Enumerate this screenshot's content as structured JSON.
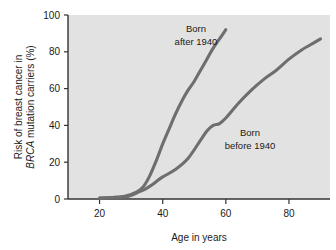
{
  "chart_data": {
    "type": "line",
    "title": "",
    "xlabel": "Age in years",
    "ylabel_line1": "Risk of breast cancer in",
    "ylabel_line2_italic": "BRCA",
    "ylabel_line2_rest": " mutation carriers (%)",
    "xlim": [
      10,
      93
    ],
    "ylim": [
      0,
      100
    ],
    "xticks": [
      20,
      40,
      60,
      80
    ],
    "xtick_labels": [
      "20",
      "40",
      "60",
      "80"
    ],
    "yticks": [
      0,
      20,
      40,
      60,
      80,
      100
    ],
    "ytick_labels": [
      "0",
      "20",
      "40",
      "60",
      "80",
      "100"
    ],
    "grid": false,
    "legend": "annotations-inline",
    "plot_background": "#e2e2e2",
    "line_color": "#6e6e6e",
    "axis_color": "#333333",
    "series": [
      {
        "name": "Born after 1940",
        "annotation_line1": "Born",
        "annotation_line2": "after 1940",
        "x": [
          20,
          24,
          28,
          30,
          32,
          34,
          36,
          38,
          40,
          42,
          44,
          46,
          48,
          50,
          52,
          54,
          56,
          58,
          60
        ],
        "values": [
          0.5,
          0.8,
          1.5,
          2.5,
          4,
          7,
          13,
          21,
          30,
          38,
          46,
          53,
          59,
          64,
          70,
          76,
          82,
          87,
          92
        ]
      },
      {
        "name": "Born before 1940",
        "annotation_line1": "Born",
        "annotation_line2": "before 1940",
        "x": [
          20,
          24,
          28,
          30,
          32,
          34,
          36,
          38,
          40,
          44,
          48,
          52,
          54,
          56,
          58,
          60,
          64,
          68,
          72,
          76,
          80,
          84,
          88,
          90
        ],
        "values": [
          0.5,
          0.8,
          1.2,
          2,
          3.5,
          5,
          7,
          9.5,
          12,
          16,
          22,
          32,
          37,
          40,
          41,
          44,
          52,
          59,
          65,
          70,
          76,
          81,
          85,
          87
        ]
      }
    ]
  }
}
